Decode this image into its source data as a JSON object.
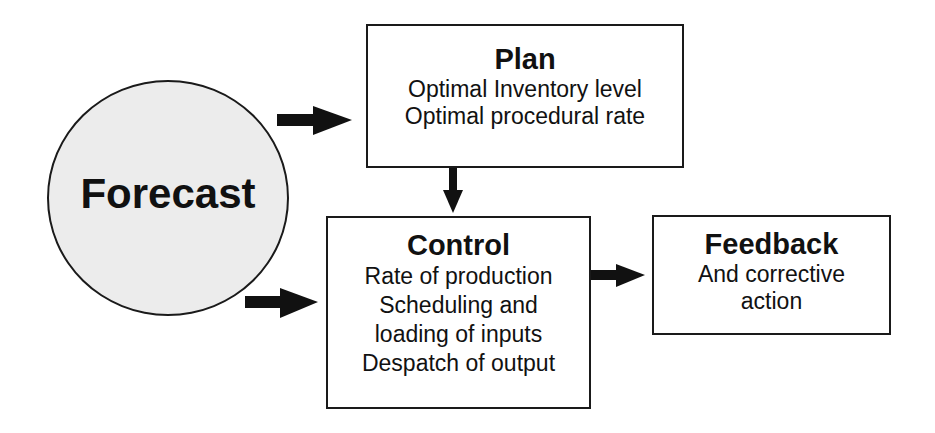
{
  "diagram": {
    "forecast": {
      "label": "Forecast"
    },
    "plan": {
      "title": "Plan",
      "lines": [
        "Optimal Inventory level",
        "Optimal procedural rate"
      ]
    },
    "control": {
      "title": "Control",
      "lines": [
        "Rate of production",
        "Scheduling and",
        "loading of inputs",
        "Despatch of output"
      ]
    },
    "feedback": {
      "title": "Feedback",
      "lines": [
        "And corrective",
        "action"
      ]
    },
    "connections": [
      {
        "from": "forecast",
        "to": "plan"
      },
      {
        "from": "forecast",
        "to": "control"
      },
      {
        "from": "plan",
        "to": "control"
      },
      {
        "from": "control",
        "to": "feedback"
      }
    ],
    "colors": {
      "stroke": "#1a1a1a",
      "circle_fill": "#ececec",
      "box_fill": "#ffffff"
    }
  }
}
